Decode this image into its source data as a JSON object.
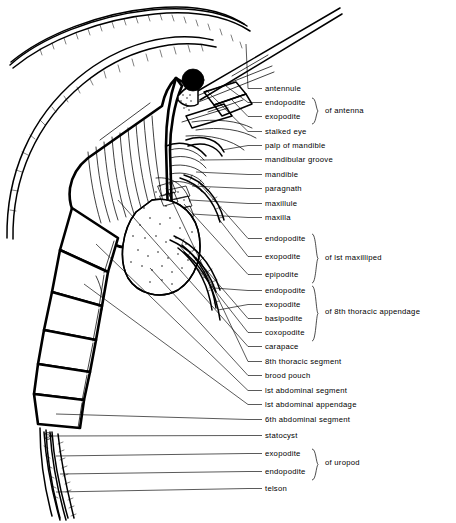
{
  "figure": {
    "orientation": "lateral view, head upper right, telson lower left",
    "style": "black-and-white line drawing with leader lines and labels",
    "ink_color": "#000000",
    "background_color": "#ffffff"
  },
  "labels": [
    {
      "id": "antennule",
      "text": "antennule",
      "y": 91,
      "group": null
    },
    {
      "id": "endopodite-antenna",
      "text": "endopodite",
      "y": 105,
      "group": "antenna"
    },
    {
      "id": "exopodite-antenna",
      "text": "exopodite",
      "y": 119,
      "group": "antenna"
    },
    {
      "id": "stalked-eye",
      "text": "stalked  eye",
      "y": 134,
      "group": null
    },
    {
      "id": "palp-of-mandible",
      "text": "palp  of  mandible",
      "y": 148,
      "group": null
    },
    {
      "id": "mandibular-groove",
      "text": "mandibular   groove",
      "y": 162,
      "group": null
    },
    {
      "id": "mandible",
      "text": "mandible",
      "y": 177,
      "group": null
    },
    {
      "id": "paragnath",
      "text": "paragnath",
      "y": 191,
      "group": null
    },
    {
      "id": "maxillule",
      "text": "maxillule",
      "y": 206,
      "group": null
    },
    {
      "id": "maxilla",
      "text": "maxilla",
      "y": 220,
      "group": null
    },
    {
      "id": "endopodite-maxilliped",
      "text": "endopodite",
      "y": 241,
      "group": "maxilliped"
    },
    {
      "id": "exopodite-maxilliped",
      "text": "exopodite",
      "y": 259,
      "group": "maxilliped"
    },
    {
      "id": "epipodite-maxilliped",
      "text": "epipodite",
      "y": 277,
      "group": "maxilliped"
    },
    {
      "id": "endopodite-thoracic",
      "text": "endopodite",
      "y": 293,
      "group": "thoracic"
    },
    {
      "id": "exopodite-thoracic",
      "text": "exopodite",
      "y": 307,
      "group": "thoracic"
    },
    {
      "id": "basipodite-thoracic",
      "text": "basipodite",
      "y": 321,
      "group": "thoracic"
    },
    {
      "id": "coxopodite-thoracic",
      "text": "coxopodite",
      "y": 335,
      "group": "thoracic"
    },
    {
      "id": "carapace",
      "text": "carapace",
      "y": 349,
      "group": null
    },
    {
      "id": "8th-thoracic-segment",
      "text": "8th  thoracic   segment",
      "y": 364,
      "group": null
    },
    {
      "id": "brood-pouch",
      "text": "brood   pouch",
      "y": 378,
      "group": null
    },
    {
      "id": "1st-abdominal-segment",
      "text": "lst  abdominal   segment",
      "y": 393,
      "group": null
    },
    {
      "id": "1st-abdominal-appendage",
      "text": "lst  abdominal   appendage",
      "y": 407,
      "group": null
    },
    {
      "id": "6th-abdominal-segment",
      "text": "6th  abdominal   segment",
      "y": 422,
      "group": null
    },
    {
      "id": "statocyst",
      "text": "statocyst",
      "y": 438,
      "group": null
    },
    {
      "id": "exopodite-uropod",
      "text": "exopodite",
      "y": 456,
      "group": "uropod"
    },
    {
      "id": "endopodite-uropod",
      "text": "endopodite",
      "y": 474,
      "group": "uropod"
    },
    {
      "id": "telson",
      "text": "telson",
      "y": 491,
      "group": null
    }
  ],
  "groups": [
    {
      "id": "antenna",
      "text": "of   antenna",
      "top": 98,
      "bottom": 124,
      "text_y": 113,
      "text_x": 325
    },
    {
      "id": "maxilliped",
      "text": "of   lst   maxilliped",
      "top": 234,
      "bottom": 283,
      "text_y": 260,
      "text_x": 325
    },
    {
      "id": "thoracic",
      "text": "of  8th  thoracic  appendage",
      "top": 286,
      "bottom": 341,
      "text_y": 314,
      "text_x": 325
    },
    {
      "id": "uropod",
      "text": "of   uropod",
      "top": 449,
      "bottom": 480,
      "text_y": 465,
      "text_x": 325
    }
  ],
  "anatomy_parts": [
    "antennule-flagellum",
    "antennal-scale",
    "compound-eye",
    "rostrum",
    "carapace",
    "mouthparts",
    "brood-pouch-marsupium",
    "thoracic-appendages",
    "abdominal-segments",
    "statocyst",
    "uropods",
    "telson"
  ]
}
